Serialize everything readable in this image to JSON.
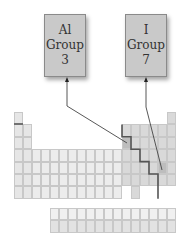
{
  "boxes": [
    {
      "symbol": "Al",
      "label": "Group",
      "number": "3"
    },
    {
      "symbol": "I",
      "label": "Group",
      "number": "7"
    }
  ],
  "table": {
    "origin_x": 14,
    "origin_y": 112,
    "cell_w": 9,
    "cell_h": 12.4,
    "rows": [
      [
        1,
        18
      ],
      [
        1,
        2,
        13,
        14,
        15,
        16,
        17,
        18
      ],
      [
        1,
        2,
        13,
        14,
        15,
        16,
        17,
        18
      ],
      [
        1,
        2,
        3,
        4,
        5,
        6,
        7,
        8,
        9,
        10,
        11,
        12,
        13,
        14,
        15,
        16,
        17,
        18
      ],
      [
        1,
        2,
        3,
        4,
        5,
        6,
        7,
        8,
        9,
        10,
        11,
        12,
        13,
        14,
        15,
        16,
        17,
        18
      ],
      [
        1,
        2,
        3,
        4,
        5,
        6,
        7,
        8,
        9,
        10,
        11,
        12,
        13,
        14,
        15,
        16,
        17,
        18
      ],
      [
        1,
        2,
        3,
        4,
        5,
        6,
        7,
        8,
        9,
        10,
        11,
        12,
        14
      ]
    ],
    "highlighted": [
      {
        "element": "Al",
        "row": 3,
        "col": 13
      },
      {
        "element": "I",
        "row": 5,
        "col": 17
      }
    ],
    "f_block": {
      "x": 50,
      "y": 208,
      "cells": 14,
      "rows": 2
    },
    "colors": {
      "s_block": "#e6e6e6",
      "d_block": "#ececec",
      "p_block": "#d9d9d9",
      "highlight": "#bdbdbd",
      "f_block_top": "#f0f0f0",
      "f_block_bottom": "#e2e2e2",
      "staircase": "#555555",
      "arrow": "#444444"
    }
  }
}
